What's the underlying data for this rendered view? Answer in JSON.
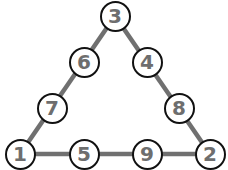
{
  "diagram": {
    "type": "magic-triangle",
    "colors": {
      "edge": "#707070",
      "node_border": "#111111",
      "node_fill": "#ffffff",
      "digit": "#6e6e6e"
    },
    "nodes": [
      {
        "id": "top",
        "value": "3",
        "x": 115,
        "y": 16
      },
      {
        "id": "left-upper",
        "value": "6",
        "x": 84,
        "y": 62
      },
      {
        "id": "right-upper",
        "value": "4",
        "x": 147,
        "y": 62
      },
      {
        "id": "left-lower",
        "value": "7",
        "x": 52,
        "y": 108
      },
      {
        "id": "right-lower",
        "value": "8",
        "x": 179,
        "y": 108
      },
      {
        "id": "bottom-left",
        "value": "1",
        "x": 20,
        "y": 154
      },
      {
        "id": "bottom-mid-left",
        "value": "5",
        "x": 84,
        "y": 154
      },
      {
        "id": "bottom-mid-right",
        "value": "9",
        "x": 147,
        "y": 154
      },
      {
        "id": "bottom-right",
        "value": "2",
        "x": 210,
        "y": 154
      }
    ],
    "sides": {
      "left": [
        "3",
        "6",
        "7",
        "1"
      ],
      "right": [
        "3",
        "4",
        "8",
        "2"
      ],
      "bottom": [
        "1",
        "5",
        "9",
        "2"
      ]
    }
  }
}
